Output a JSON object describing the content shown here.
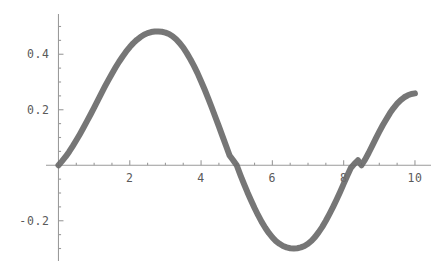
{
  "chart_data": {
    "type": "line",
    "title": "",
    "subtitle": "",
    "xlabel": "",
    "ylabel": "",
    "xlim": [
      -0.35,
      10.45
    ],
    "ylim": [
      -0.345,
      0.545
    ],
    "grid": false,
    "legend": null,
    "style": "mathematica-plot",
    "line_color": "#6a6a6a",
    "axis_color": "#9a9a9a",
    "background_color": "#ffffff",
    "line_width_px": 6,
    "x_axis": {
      "major_ticks": [
        2,
        4,
        6,
        8,
        10
      ],
      "major_tick_labels": [
        "2",
        "4",
        "6",
        "8",
        "10"
      ],
      "minor_tick_step": 0.5,
      "axis_value": 0,
      "label_position": "below"
    },
    "y_axis": {
      "major_ticks": [
        -0.2,
        0.2,
        0.4
      ],
      "major_tick_labels": [
        "-0.2",
        "0.2",
        "0.4"
      ],
      "minor_tick_step": 0.05,
      "axis_value": 0,
      "label_position": "left"
    },
    "annotations": {
      "maximum": {
        "x": 3.1,
        "y": 0.48
      },
      "minimum": {
        "x": 6.75,
        "y": 0.3
      },
      "zero_crossings": [
        0.0,
        5.0,
        8.5
      ],
      "endpoint_start": {
        "x": 0.0,
        "y": 0.0
      },
      "endpoint_end": {
        "x": 10.0,
        "y": 0.26
      }
    },
    "series": [
      {
        "name": "curve",
        "color": "#6a6a6a",
        "x": [
          0,
          0.1,
          0.2,
          0.3,
          0.4,
          0.5,
          0.6,
          0.7,
          0.8,
          0.9,
          1,
          1.1,
          1.2,
          1.3,
          1.4,
          1.5,
          1.6,
          1.7,
          1.8,
          1.9,
          2,
          2.1,
          2.2,
          2.3,
          2.4,
          2.5,
          2.6,
          2.7,
          2.8,
          2.9,
          3,
          3.1,
          3.2,
          3.3,
          3.4,
          3.5,
          3.6,
          3.7,
          3.8,
          3.9,
          4,
          4.1,
          4.2,
          4.3,
          4.4,
          4.5,
          4.6,
          4.7,
          4.8,
          4.9,
          5,
          5.1,
          5.2,
          5.3,
          5.4,
          5.5,
          5.6,
          5.7,
          5.8,
          5.9,
          6,
          6.1,
          6.2,
          6.3,
          6.4,
          6.5,
          6.6,
          6.7,
          6.8,
          6.9,
          7,
          7.1,
          7.2,
          7.3,
          7.4,
          7.5,
          7.6,
          7.7,
          7.8,
          7.9,
          8,
          8.1,
          8.2,
          8.3,
          8.4,
          8.5,
          8.6,
          8.7,
          8.8,
          8.9,
          9,
          9.1,
          9.2,
          9.3,
          9.4,
          9.5,
          9.6,
          9.7,
          9.8,
          9.9,
          10
        ],
        "y": [
          0,
          0.015,
          0.031,
          0.049,
          0.069,
          0.09,
          0.112,
          0.135,
          0.159,
          0.183,
          0.208,
          0.233,
          0.258,
          0.283,
          0.307,
          0.33,
          0.352,
          0.373,
          0.392,
          0.41,
          0.426,
          0.44,
          0.452,
          0.462,
          0.47,
          0.476,
          0.48,
          0.482,
          0.482,
          0.481,
          0.478,
          0.473,
          0.465,
          0.454,
          0.44,
          0.424,
          0.404,
          0.382,
          0.358,
          0.332,
          0.303,
          0.273,
          0.241,
          0.208,
          0.174,
          0.14,
          0.105,
          0.07,
          0.035,
          0.018,
          0,
          -0.034,
          -0.066,
          -0.097,
          -0.126,
          -0.154,
          -0.18,
          -0.204,
          -0.225,
          -0.244,
          -0.26,
          -0.273,
          -0.283,
          -0.291,
          -0.296,
          -0.299,
          -0.3,
          -0.299,
          -0.296,
          -0.291,
          -0.283,
          -0.272,
          -0.258,
          -0.241,
          -0.222,
          -0.2,
          -0.176,
          -0.151,
          -0.124,
          -0.096,
          -0.067,
          -0.038,
          -0.01,
          0.005,
          0.018,
          0,
          0.02,
          0.044,
          0.07,
          0.096,
          0.121,
          0.145,
          0.167,
          0.188,
          0.206,
          0.222,
          0.235,
          0.245,
          0.252,
          0.257,
          0.259
        ]
      }
    ]
  }
}
